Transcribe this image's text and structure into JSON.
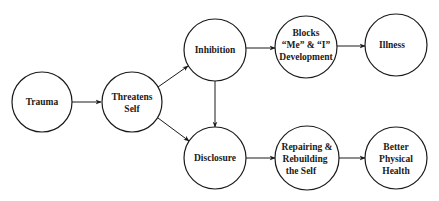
{
  "diagram": {
    "type": "flow",
    "nodes": [
      {
        "id": "trauma",
        "lines": [
          "Trauma"
        ],
        "cx": 42,
        "cy": 102,
        "r": 30
      },
      {
        "id": "threatens",
        "lines": [
          "Threatens",
          "Self"
        ],
        "cx": 132,
        "cy": 102,
        "r": 30
      },
      {
        "id": "inhibition",
        "lines": [
          "Inhibition"
        ],
        "cx": 215,
        "cy": 50,
        "r": 31
      },
      {
        "id": "disclosure",
        "lines": [
          "Disclosure"
        ],
        "cx": 215,
        "cy": 158,
        "r": 31
      },
      {
        "id": "blocks",
        "lines": [
          "Blocks",
          "“Me” & “I”",
          "Development"
        ],
        "cx": 306,
        "cy": 47,
        "r": 31
      },
      {
        "id": "illness",
        "lines": [
          "Illness"
        ],
        "cx": 396,
        "cy": 45,
        "r": 31
      },
      {
        "id": "repairing",
        "lines": [
          "Repairing &",
          "Rebuilding",
          "the Self"
        ],
        "cx": 307,
        "cy": 158,
        "r": 32
      },
      {
        "id": "better",
        "lines": [
          "Better",
          "Physical",
          "Health"
        ],
        "cx": 396,
        "cy": 158,
        "r": 31
      }
    ],
    "edges": [
      {
        "from": "trauma",
        "to": "threatens"
      },
      {
        "from": "threatens",
        "to": "inhibition"
      },
      {
        "from": "threatens",
        "to": "disclosure"
      },
      {
        "from": "inhibition",
        "to": "disclosure"
      },
      {
        "from": "inhibition",
        "to": "blocks"
      },
      {
        "from": "blocks",
        "to": "illness"
      },
      {
        "from": "disclosure",
        "to": "repairing"
      },
      {
        "from": "repairing",
        "to": "better"
      }
    ]
  },
  "labels": {
    "trauma": "Trauma",
    "threatens_1": "Threatens",
    "threatens_2": "Self",
    "inhibition": "Inhibition",
    "disclosure": "Disclosure",
    "blocks_1": "Blocks",
    "blocks_2": "“Me” & “I”",
    "blocks_3": "Development",
    "illness": "Illness",
    "repairing_1": "Repairing &",
    "repairing_2": "Rebuilding",
    "repairing_3": "the Self",
    "better_1": "Better",
    "better_2": "Physical",
    "better_3": "Health"
  }
}
